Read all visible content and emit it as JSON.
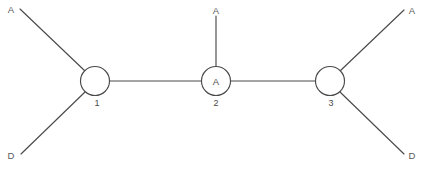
{
  "diagram": {
    "background_color": "#ffffff",
    "line_color": "#4a4a4a",
    "text_color": "#5a5a5a",
    "width": 424,
    "height": 170,
    "nodes": [
      {
        "id": "node-1",
        "number": "1",
        "inner_label": "",
        "cx": 95,
        "cy": 81,
        "r": 14.5,
        "number_x": 97,
        "number_y": 103
      },
      {
        "id": "node-2",
        "number": "2",
        "inner_label": "A",
        "cx": 216,
        "cy": 81,
        "r": 14.5,
        "number_x": 216,
        "number_y": 103
      },
      {
        "id": "node-3",
        "number": "3",
        "inner_label": "",
        "cx": 330,
        "cy": 81,
        "r": 14.5,
        "number_x": 331,
        "number_y": 103
      }
    ],
    "terminals": [
      {
        "id": "terminal-top-left",
        "label": "A",
        "x": 11,
        "y": 9
      },
      {
        "id": "terminal-bottom-left",
        "label": "D",
        "x": 11,
        "y": 155
      },
      {
        "id": "terminal-top-center",
        "label": "A",
        "x": 216,
        "y": 10
      },
      {
        "id": "terminal-top-right",
        "label": "A",
        "x": 412,
        "y": 10
      },
      {
        "id": "terminal-bottom-right",
        "label": "D",
        "x": 412,
        "y": 155
      }
    ],
    "edges": [
      {
        "id": "edge-node1-to-top-left-A",
        "x1": 85,
        "y1": 71,
        "x2": 20,
        "y2": 9
      },
      {
        "id": "edge-node1-to-bottom-left-D",
        "x1": 85,
        "y1": 92,
        "x2": 21,
        "y2": 154
      },
      {
        "id": "edge-node1-to-node2",
        "x1": 110,
        "y1": 81,
        "x2": 201,
        "y2": 81
      },
      {
        "id": "edge-node2-to-top-center-A",
        "x1": 216,
        "y1": 66,
        "x2": 216,
        "y2": 16
      },
      {
        "id": "edge-node2-to-node3",
        "x1": 231,
        "y1": 81,
        "x2": 315,
        "y2": 81
      },
      {
        "id": "edge-node3-to-top-right-A",
        "x1": 340,
        "y1": 71,
        "x2": 404,
        "y2": 10
      },
      {
        "id": "edge-node3-to-bottom-right-D",
        "x1": 340,
        "y1": 92,
        "x2": 404,
        "y2": 154
      }
    ]
  }
}
